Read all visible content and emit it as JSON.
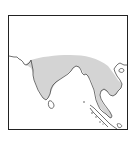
{
  "map": {
    "type": "species-range-map",
    "region": "South and Southeast Asia",
    "colors": {
      "background": "#ffffff",
      "frame": "#222222",
      "coastline": "#333333",
      "range_fill": "#d4d4d4",
      "sea": "#ffffff"
    },
    "features": {
      "range_area": "Indian subcontinent through Indochina and Malay Peninsula",
      "islands_outlined": [
        "Sri Lanka",
        "Sumatra",
        "Hainan",
        "Andaman and Nicobar Islands"
      ]
    }
  }
}
